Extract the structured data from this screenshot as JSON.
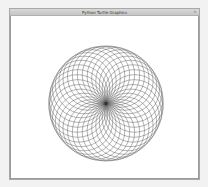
{
  "window": {
    "title": "Python Turtle Graphics",
    "close_glyph": "×"
  },
  "drawing": {
    "type": "spirograph",
    "circle_count": 36,
    "circle_radius": 29,
    "center": [
      96,
      88
    ],
    "rotation_step_degrees": 10,
    "stroke_color": "#555555",
    "background_color": "#ffffff"
  },
  "colors": {
    "titlebar": "#cccccc",
    "window_border": "#a8a8a8",
    "canvas": "#ffffff",
    "desktop": "#f2f2f2"
  }
}
